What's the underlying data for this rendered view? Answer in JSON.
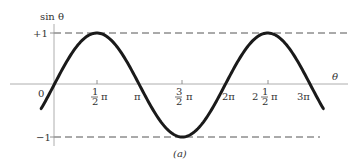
{
  "chart_data": {
    "type": "line",
    "title": "",
    "xlabel": "θ",
    "ylabel": "sin θ",
    "function": "sin",
    "xlim_pi": [
      -0.15,
      3.15
    ],
    "ylim": [
      -1,
      1
    ],
    "x_ticks": [
      {
        "value_pi": 0,
        "label": "0"
      },
      {
        "value_pi": 0.5,
        "label": "1/2 π"
      },
      {
        "value_pi": 1,
        "label": "π"
      },
      {
        "value_pi": 1.5,
        "label": "3/2 π"
      },
      {
        "value_pi": 2,
        "label": "2π"
      },
      {
        "value_pi": 2.5,
        "label": "2 1/2 π"
      },
      {
        "value_pi": 3,
        "label": "3π"
      }
    ],
    "y_ticks": [
      {
        "value": 1,
        "label": "+1"
      },
      {
        "value": -1,
        "label": "-1"
      }
    ],
    "reference_lines": [
      {
        "y": 1,
        "style": "dashed"
      },
      {
        "y": -1,
        "style": "dashed"
      }
    ],
    "series": [
      {
        "name": "sin θ",
        "x_pi": [
          0,
          0.5,
          1,
          1.5,
          2,
          2.5,
          3
        ],
        "values": [
          0,
          1,
          0,
          -1,
          0,
          1,
          0
        ]
      }
    ],
    "grid": false,
    "caption": "(a)"
  },
  "labels": {
    "ylabel": "sin θ",
    "xlabel": "θ",
    "plus_one": "+1",
    "minus_one": "−1",
    "zero": "0",
    "caption": "(a)",
    "half_num": "1",
    "half_den": "2",
    "three_num": "3",
    "pi": "π",
    "two_pi": "2π",
    "three_pi": "3π",
    "two": "2"
  }
}
